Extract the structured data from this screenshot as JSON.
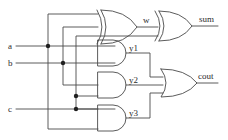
{
  "diagram": {
    "type": "logic-circuit-schematic",
    "stroke_color": "#4a4a4a",
    "text_color": "#2b2b2b",
    "background_color": "#ffffff",
    "inputs": [
      {
        "id": "a",
        "label": "a",
        "y": 46
      },
      {
        "id": "b",
        "label": "b",
        "y": 63
      },
      {
        "id": "c",
        "label": "c",
        "y": 109
      }
    ],
    "outputs": [
      {
        "id": "sum",
        "label": "sum",
        "y": 26
      },
      {
        "id": "cout",
        "label": "cout",
        "y": 83
      }
    ],
    "nets": [
      {
        "id": "w",
        "label": "w",
        "source": "xor1",
        "targets": [
          "xor2"
        ]
      },
      {
        "id": "y1",
        "label": "y1",
        "source": "and1",
        "targets": [
          "or1"
        ]
      },
      {
        "id": "y2",
        "label": "y2",
        "source": "and2",
        "targets": [
          "or1"
        ]
      },
      {
        "id": "y3",
        "label": "y3",
        "source": "and3",
        "targets": [
          "or1"
        ]
      }
    ],
    "gates": [
      {
        "id": "xor1",
        "kind": "XOR",
        "label": "",
        "inputs": [
          "a",
          "b"
        ],
        "output": "w"
      },
      {
        "id": "xor2",
        "kind": "XOR",
        "label": "",
        "inputs": [
          "w",
          "c"
        ],
        "output": "sum"
      },
      {
        "id": "and1",
        "kind": "AND",
        "label": "y1",
        "inputs": [
          "a",
          "b"
        ],
        "output": "y1"
      },
      {
        "id": "and2",
        "kind": "AND",
        "label": "y2",
        "inputs": [
          "b",
          "c"
        ],
        "output": "y2"
      },
      {
        "id": "and3",
        "kind": "AND",
        "label": "y3",
        "inputs": [
          "a",
          "c"
        ],
        "output": "y3"
      },
      {
        "id": "or1",
        "kind": "OR",
        "label": "",
        "inputs": [
          "y1",
          "y2",
          "y3"
        ],
        "output": "cout"
      }
    ],
    "junction_dots": [
      {
        "id": "dot-a",
        "x": 48,
        "y": 46
      },
      {
        "id": "dot-b",
        "x": 63,
        "y": 63
      },
      {
        "id": "dot-c1",
        "x": 76,
        "y": 96
      },
      {
        "id": "dot-c2",
        "x": 76,
        "y": 109
      }
    ]
  }
}
